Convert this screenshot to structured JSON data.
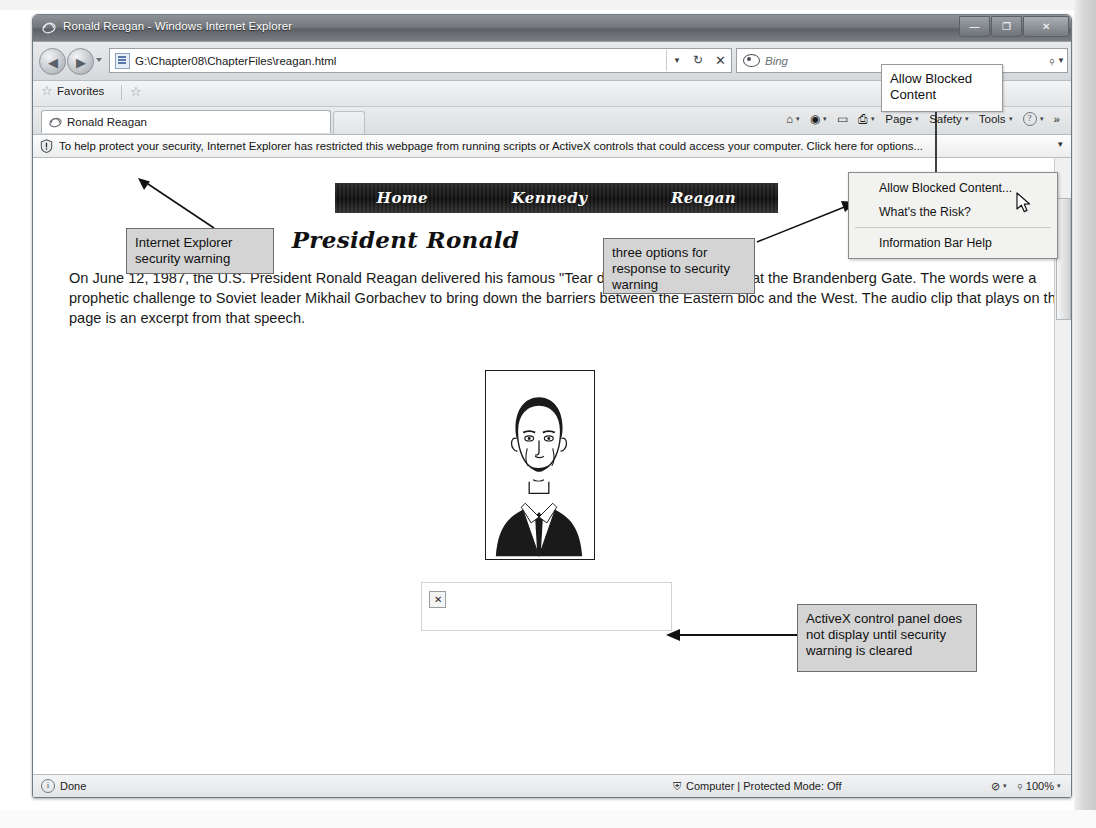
{
  "window": {
    "title": "Ronald Reagan - Windows Internet Explorer",
    "minimize_label": "—",
    "maximize_label": "❐",
    "close_label": "✕"
  },
  "navigation": {
    "back_label": "◀",
    "forward_label": "▶",
    "address_value": "G:\\Chapter08\\ChapterFiles\\reagan.html",
    "address_dropdown_label": "▼",
    "refresh_label": "↻",
    "stop_label": "✕",
    "search_value": "Bing",
    "search_button_label": "⌕",
    "search_dropdown_label": "▼"
  },
  "favorites_bar": {
    "favorites_label": "Favorites",
    "star_glyph": "☆",
    "add_glyph": "☆"
  },
  "tabs": [
    {
      "title": "Ronald Reagan"
    }
  ],
  "command_bar": {
    "home_glyph": "⌂",
    "feeds_glyph": "◉",
    "mail_glyph": "▭",
    "print_glyph": "⎙",
    "page_label": "Page",
    "safety_label": "Safety",
    "tools_label": "Tools",
    "help_glyph": "?",
    "overflow_label": "»",
    "caret": "▾"
  },
  "information_bar": {
    "text": "To help protect your security, Internet Explorer has restricted this webpage from running scripts or ActiveX controls that could access your computer. Click here for options...",
    "chevron": "▾"
  },
  "dropdown_menu": {
    "items": [
      {
        "label": "Allow Blocked Content..."
      },
      {
        "label": "What's the Risk?"
      },
      {
        "label": "Information Bar Help"
      }
    ]
  },
  "webpage": {
    "nav_links": [
      "Home",
      "Kennedy",
      "Reagan"
    ],
    "heading": "President Ronald",
    "paragraph": "On June 12, 1987, the U.S. President Ronald Reagan delivered his famous \"Tear down this wall!\" speech at the Brandenberg Gate. The words were a prophetic challenge to Soviet leader Mikhail Gorbachev to bring down the barriers between the Eastern bloc and the West. The audio clip that plays on this page is an excerpt from that speech.",
    "broken_image_glyph": "✕"
  },
  "status_bar": {
    "status_text": "Done",
    "info_glyph": "i",
    "zone_text": "Computer | Protected Mode: Off",
    "zone_glyph": "⛨",
    "privacy_glyph": "⊘",
    "caret": "▾",
    "zoom_glyph": "⌕",
    "zoom_level": "100%"
  },
  "annotations": [
    {
      "id": "allow-blocked-content",
      "text": "Allow Blocked Content"
    },
    {
      "id": "ie-security-warning",
      "text": "Internet Explorer security warning"
    },
    {
      "id": "three-options",
      "text": "three options for response to security warning"
    },
    {
      "id": "activex-panel-note",
      "text": "ActiveX control panel does not display until security warning is cleared"
    }
  ],
  "colors": {
    "callout_fill": "#d4d4d4",
    "callout_border": "#6e6e6e",
    "banner_bg": "#111111",
    "window_chrome": "#75797e"
  }
}
